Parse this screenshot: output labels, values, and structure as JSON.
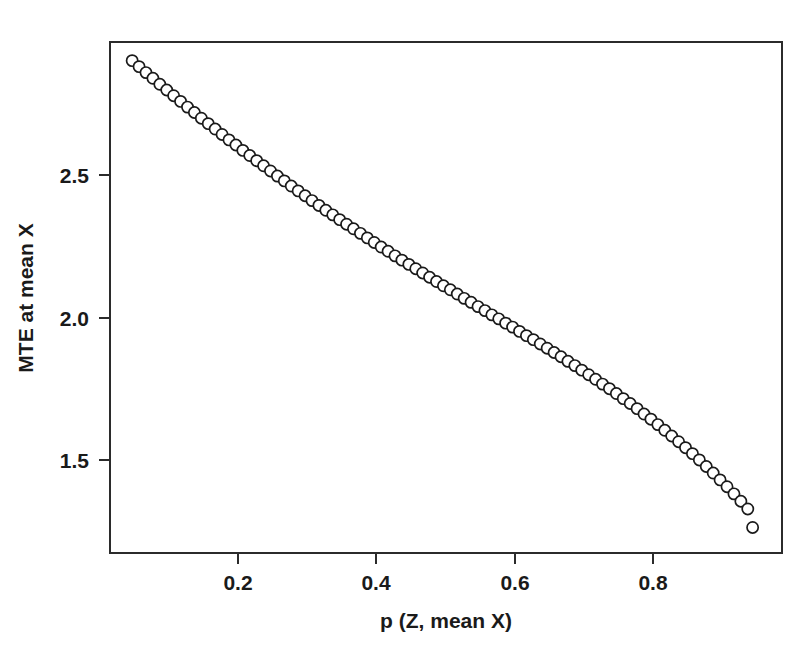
{
  "chart_data": {
    "type": "scatter",
    "title": "",
    "subtitle": "",
    "xlabel": "p (Z, mean X)",
    "ylabel": "MTE at mean X",
    "xlim": [
      0.0,
      0.972
    ],
    "ylim": [
      1.205,
      2.99
    ],
    "xticks": [
      0.2,
      0.4,
      0.6,
      0.8
    ],
    "xtick_labels": [
      "0.2",
      "0.4",
      "0.6",
      "0.8"
    ],
    "yticks": [
      1.5,
      2.0,
      2.5
    ],
    "ytick_labels": [
      "1.5",
      "2.0",
      "2.5"
    ],
    "grid": false,
    "legend": null,
    "marker": "open-circle",
    "marker_color": "#1a1a1a",
    "marker_fill": "#ffffff",
    "frame_color": "#2b2b2b",
    "background": "#ffffff",
    "annotations": [],
    "series": [
      {
        "name": "MTE at mean X",
        "x": [
          0.047,
          0.057,
          0.067,
          0.077,
          0.087,
          0.097,
          0.107,
          0.117,
          0.127,
          0.137,
          0.147,
          0.157,
          0.167,
          0.177,
          0.187,
          0.197,
          0.207,
          0.217,
          0.227,
          0.237,
          0.247,
          0.257,
          0.267,
          0.277,
          0.287,
          0.297,
          0.307,
          0.317,
          0.327,
          0.337,
          0.347,
          0.357,
          0.367,
          0.377,
          0.387,
          0.397,
          0.407,
          0.417,
          0.427,
          0.437,
          0.447,
          0.457,
          0.467,
          0.477,
          0.487,
          0.497,
          0.507,
          0.517,
          0.527,
          0.537,
          0.547,
          0.557,
          0.567,
          0.577,
          0.587,
          0.597,
          0.607,
          0.617,
          0.627,
          0.637,
          0.647,
          0.657,
          0.667,
          0.677,
          0.687,
          0.697,
          0.707,
          0.717,
          0.727,
          0.737,
          0.747,
          0.757,
          0.767,
          0.777,
          0.787,
          0.797,
          0.807,
          0.817,
          0.827,
          0.837,
          0.847,
          0.857,
          0.867,
          0.877,
          0.887,
          0.897,
          0.907,
          0.917,
          0.927,
          0.937,
          0.944
        ],
        "y": [
          2.903,
          2.882,
          2.861,
          2.841,
          2.82,
          2.8,
          2.78,
          2.76,
          2.74,
          2.721,
          2.701,
          2.682,
          2.663,
          2.644,
          2.625,
          2.607,
          2.588,
          2.57,
          2.552,
          2.534,
          2.516,
          2.498,
          2.481,
          2.463,
          2.446,
          2.429,
          2.412,
          2.395,
          2.378,
          2.362,
          2.345,
          2.329,
          2.313,
          2.297,
          2.281,
          2.265,
          2.249,
          2.234,
          2.218,
          2.203,
          2.188,
          2.173,
          2.158,
          2.143,
          2.128,
          2.113,
          2.099,
          2.084,
          2.069,
          2.055,
          2.04,
          2.026,
          2.011,
          1.997,
          1.982,
          1.968,
          1.953,
          1.938,
          1.924,
          1.909,
          1.894,
          1.879,
          1.864,
          1.848,
          1.833,
          1.817,
          1.801,
          1.785,
          1.768,
          1.752,
          1.735,
          1.717,
          1.7,
          1.682,
          1.663,
          1.645,
          1.626,
          1.606,
          1.586,
          1.566,
          1.545,
          1.524,
          1.502,
          1.479,
          1.456,
          1.432,
          1.408,
          1.383,
          1.357,
          1.33,
          1.265
        ]
      }
    ]
  },
  "axis": {
    "x_title": "p (Z, mean X)",
    "y_title": "MTE at mean X",
    "x_tick_0": "0.2",
    "x_tick_1": "0.4",
    "x_tick_2": "0.6",
    "x_tick_3": "0.8",
    "y_tick_0": "2.5",
    "y_tick_1": "2.0",
    "y_tick_2": "1.5"
  }
}
